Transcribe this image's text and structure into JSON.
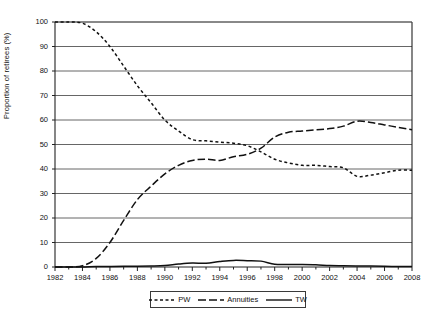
{
  "chart_data": {
    "type": "line",
    "title": "",
    "xlabel": "",
    "ylabel": "Proportion of retirees (%)",
    "xlim": [
      1982,
      2008
    ],
    "ylim": [
      0,
      100
    ],
    "grid": true,
    "legend_position": "bottom-center",
    "yticks": [
      0,
      10,
      20,
      30,
      40,
      50,
      60,
      70,
      80,
      90,
      100
    ],
    "xticks": [
      1982,
      1984,
      1986,
      1988,
      1990,
      1992,
      1994,
      1996,
      1998,
      2000,
      2002,
      2004,
      2006,
      2008
    ],
    "x": [
      1982,
      1983,
      1984,
      1985,
      1986,
      1987,
      1988,
      1989,
      1990,
      1991,
      1992,
      1993,
      1994,
      1995,
      1996,
      1997,
      1998,
      1999,
      2000,
      2001,
      2002,
      2003,
      2004,
      2005,
      2006,
      2007,
      2008
    ],
    "series": [
      {
        "name": "PW",
        "style": "short-dash",
        "color": "#111111",
        "values": [
          100,
          100,
          99.5,
          96,
          90,
          82,
          74,
          67,
          60,
          55.5,
          52,
          51.5,
          51,
          50.5,
          49.5,
          47,
          44,
          42.5,
          41.5,
          41.5,
          41,
          40.5,
          37,
          37.5,
          38.5,
          39.5,
          39.5
        ]
      },
      {
        "name": "Annuities",
        "style": "long-dash",
        "color": "#111111",
        "values": [
          0,
          0,
          0.5,
          3.5,
          10,
          19,
          27.5,
          33,
          38,
          41.5,
          43.5,
          44,
          43.5,
          45,
          46,
          48.5,
          53,
          55,
          55.5,
          56,
          56.5,
          57.5,
          59.5,
          59,
          58,
          57,
          56
        ]
      },
      {
        "name": "TW",
        "style": "solid",
        "color": "#111111",
        "values": [
          0,
          0,
          0,
          0.2,
          0.2,
          0.3,
          0.3,
          0.4,
          0.6,
          1.2,
          1.6,
          1.5,
          2.2,
          2.7,
          2.6,
          2.4,
          1.1,
          1.0,
          1.0,
          0.9,
          0.6,
          0.5,
          0.4,
          0.4,
          0.3,
          0.2,
          0.2
        ]
      }
    ]
  },
  "axis": {
    "y_title": "Proportion of retirees (%)"
  },
  "legend": {
    "items": [
      {
        "label": "PW",
        "style": "short-dash"
      },
      {
        "label": "Annuities",
        "style": "long-dash"
      },
      {
        "label": "TW",
        "style": "solid"
      }
    ]
  },
  "colors": {
    "line": "#111111",
    "grid": "#555555",
    "axis": "#222222",
    "background": "#ffffff"
  }
}
